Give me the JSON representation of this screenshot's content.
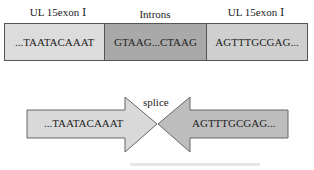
{
  "top_row": {
    "labels": {
      "left": "UL 15exon Ⅰ",
      "middle": "Introns",
      "right": "UL 15exon Ⅰ"
    },
    "boxes": {
      "exon_left": "...TAATACAAAT",
      "intron": "GTAAG...CTAAG",
      "exon_right": "AGTTTGCGAG..."
    }
  },
  "bottom_row": {
    "splice_label": "splice",
    "left_arrow_text": "...TAATACAAAT",
    "right_arrow_text": "AGTTTGCGAG..."
  },
  "colors": {
    "exon_left": "#dcdcdc",
    "intron": "#a9a9a9",
    "exon_right": "#cfcfcf",
    "arrow_left": "#d9d9d9",
    "arrow_right": "#bdbdbd",
    "border": "#555555"
  }
}
